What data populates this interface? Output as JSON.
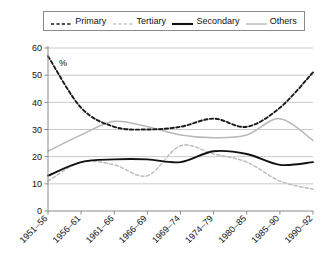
{
  "chart_data": {
    "type": "line",
    "title": "",
    "xlabel": "",
    "ylabel": "%",
    "unit_annotation": "%",
    "categories": [
      "1951–56",
      "1956–61",
      "1961–66",
      "1966–69",
      "1969–74",
      "1974–79",
      "1980–85",
      "1985–90",
      "1990–92"
    ],
    "ylim": [
      0,
      60
    ],
    "ytick_step": 10,
    "yticks": [
      "0",
      "10",
      "20",
      "30",
      "40",
      "50",
      "60"
    ],
    "grid": "horizontal",
    "legend_position": "top",
    "smoothing": "spline",
    "series": [
      {
        "name": "Primary",
        "style": "dashed",
        "color": "#1a1a1a",
        "values": [
          57,
          38,
          31,
          30,
          31,
          34,
          31,
          38,
          51
        ]
      },
      {
        "name": "Tertiary",
        "style": "dashed",
        "color": "#bdbdbd",
        "values": [
          11,
          18,
          17,
          13,
          24,
          21,
          18,
          11,
          8
        ]
      },
      {
        "name": "Secondary",
        "style": "solid",
        "color": "#111111",
        "values": [
          13,
          18,
          19,
          19,
          18,
          22,
          21,
          17,
          18
        ]
      },
      {
        "name": "Others",
        "style": "solid",
        "color": "#b8b8b8",
        "values": [
          22,
          28,
          33,
          31,
          28,
          27,
          28,
          34,
          26
        ]
      }
    ]
  },
  "legend": {
    "items": [
      {
        "label": "Primary"
      },
      {
        "label": "Tertiary"
      },
      {
        "label": "Secondary"
      },
      {
        "label": "Others"
      }
    ]
  },
  "colors": {
    "axis": "#8a8a8a",
    "grid": "#c9c9c9",
    "dark_series": "#1a1a1a",
    "light_series": "#bdbdbd",
    "background": "#ffffff"
  }
}
